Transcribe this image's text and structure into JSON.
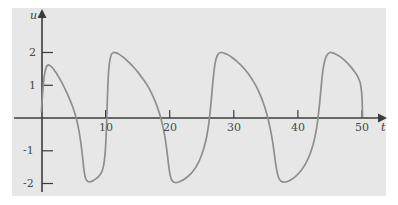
{
  "figure": {
    "background_color": "#ffffff",
    "plot_background_color": "#e7e7e7",
    "axis_color": "#3c3c3c",
    "curve_color": "#8e8e8e"
  },
  "axis": {
    "x_label": "t",
    "y_label": "u"
  },
  "ticks": {
    "x": [
      {
        "value": 10,
        "label": "10"
      },
      {
        "value": 20,
        "label": "20"
      },
      {
        "value": 30,
        "label": "30"
      },
      {
        "value": 40,
        "label": "40"
      },
      {
        "value": 50,
        "label": "50"
      }
    ],
    "y": [
      {
        "value": 2,
        "label": "2"
      },
      {
        "value": 1,
        "label": "1"
      },
      {
        "value": -1,
        "label": "-1"
      },
      {
        "value": -2,
        "label": "-2"
      }
    ]
  },
  "chart_data": {
    "type": "line",
    "title": "",
    "xlabel": "t",
    "ylabel": "u",
    "xlim": [
      -1,
      53
    ],
    "ylim": [
      -2.45,
      2.45
    ],
    "grid": false,
    "legend": "none",
    "xticks": [
      10,
      20,
      30,
      40,
      50
    ],
    "yticks": [
      2,
      1,
      -1,
      -2
    ],
    "period": 11.2,
    "amplitude_max": 2.0,
    "amplitude_min": -1.95,
    "series": [
      {
        "name": "u(t)",
        "color": "#8e8e8e",
        "points": [
          [
            0.0,
            0.2
          ],
          [
            0.12,
            0.55
          ],
          [
            0.25,
            0.9
          ],
          [
            0.4,
            1.2
          ],
          [
            0.55,
            1.4
          ],
          [
            0.72,
            1.53
          ],
          [
            0.9,
            1.6
          ],
          [
            1.1,
            1.62
          ],
          [
            1.35,
            1.6
          ],
          [
            1.65,
            1.55
          ],
          [
            2.0,
            1.46
          ],
          [
            2.4,
            1.35
          ],
          [
            2.85,
            1.2
          ],
          [
            3.35,
            1.02
          ],
          [
            3.85,
            0.82
          ],
          [
            4.35,
            0.6
          ],
          [
            4.8,
            0.38
          ],
          [
            5.2,
            0.15
          ],
          [
            5.55,
            -0.1
          ],
          [
            5.85,
            -0.38
          ],
          [
            6.1,
            -0.68
          ],
          [
            6.3,
            -0.98
          ],
          [
            6.47,
            -1.28
          ],
          [
            6.62,
            -1.55
          ],
          [
            6.78,
            -1.75
          ],
          [
            6.95,
            -1.87
          ],
          [
            7.2,
            -1.93
          ],
          [
            7.55,
            -1.95
          ],
          [
            8.0,
            -1.92
          ],
          [
            8.5,
            -1.86
          ],
          [
            9.0,
            -1.77
          ],
          [
            9.4,
            -1.65
          ],
          [
            9.65,
            -1.5
          ],
          [
            9.82,
            -1.3
          ],
          [
            9.95,
            -1.05
          ],
          [
            10.05,
            -0.75
          ],
          [
            10.13,
            -0.4
          ],
          [
            10.2,
            0.0
          ],
          [
            10.27,
            0.45
          ],
          [
            10.35,
            0.9
          ],
          [
            10.45,
            1.3
          ],
          [
            10.58,
            1.62
          ],
          [
            10.75,
            1.83
          ],
          [
            10.95,
            1.95
          ],
          [
            11.25,
            2.0
          ],
          [
            11.65,
            1.99
          ],
          [
            12.1,
            1.95
          ],
          [
            12.6,
            1.88
          ],
          [
            13.15,
            1.79
          ],
          [
            13.75,
            1.68
          ],
          [
            14.4,
            1.55
          ],
          [
            15.05,
            1.4
          ],
          [
            15.7,
            1.23
          ],
          [
            16.35,
            1.05
          ],
          [
            16.95,
            0.85
          ],
          [
            17.5,
            0.62
          ],
          [
            18.0,
            0.38
          ],
          [
            18.45,
            0.12
          ],
          [
            18.85,
            -0.18
          ],
          [
            19.2,
            -0.5
          ],
          [
            19.48,
            -0.85
          ],
          [
            19.7,
            -1.2
          ],
          [
            19.9,
            -1.52
          ],
          [
            20.1,
            -1.76
          ],
          [
            20.35,
            -1.9
          ],
          [
            20.7,
            -1.96
          ],
          [
            21.15,
            -1.97
          ],
          [
            21.7,
            -1.93
          ],
          [
            22.3,
            -1.87
          ],
          [
            22.95,
            -1.77
          ],
          [
            23.55,
            -1.65
          ],
          [
            24.1,
            -1.5
          ],
          [
            24.6,
            -1.32
          ],
          [
            25.05,
            -1.1
          ],
          [
            25.45,
            -0.85
          ],
          [
            25.8,
            -0.55
          ],
          [
            26.08,
            -0.22
          ],
          [
            26.3,
            0.15
          ],
          [
            26.5,
            0.55
          ],
          [
            26.68,
            0.95
          ],
          [
            26.88,
            1.35
          ],
          [
            27.1,
            1.67
          ],
          [
            27.38,
            1.88
          ],
          [
            27.72,
            1.98
          ],
          [
            28.15,
            2.0
          ],
          [
            28.65,
            1.97
          ],
          [
            29.2,
            1.92
          ],
          [
            29.8,
            1.84
          ],
          [
            30.45,
            1.74
          ],
          [
            31.1,
            1.62
          ],
          [
            31.75,
            1.48
          ],
          [
            32.4,
            1.32
          ],
          [
            33.0,
            1.14
          ],
          [
            33.58,
            0.94
          ],
          [
            34.1,
            0.72
          ],
          [
            34.58,
            0.48
          ],
          [
            35.02,
            0.22
          ],
          [
            35.42,
            -0.08
          ],
          [
            35.78,
            -0.4
          ],
          [
            36.08,
            -0.74
          ],
          [
            36.33,
            -1.08
          ],
          [
            36.55,
            -1.4
          ],
          [
            36.78,
            -1.66
          ],
          [
            37.05,
            -1.84
          ],
          [
            37.4,
            -1.93
          ],
          [
            37.85,
            -1.96
          ],
          [
            38.4,
            -1.94
          ],
          [
            39.0,
            -1.88
          ],
          [
            39.62,
            -1.79
          ],
          [
            40.22,
            -1.67
          ],
          [
            40.78,
            -1.53
          ],
          [
            41.3,
            -1.36
          ],
          [
            41.78,
            -1.16
          ],
          [
            42.2,
            -0.93
          ],
          [
            42.58,
            -0.66
          ],
          [
            42.9,
            -0.35
          ],
          [
            43.15,
            0.0
          ],
          [
            43.38,
            0.4
          ],
          [
            43.58,
            0.82
          ],
          [
            43.78,
            1.22
          ],
          [
            44.0,
            1.56
          ],
          [
            44.28,
            1.8
          ],
          [
            44.62,
            1.94
          ],
          [
            45.05,
            2.0
          ],
          [
            45.55,
            1.98
          ],
          [
            46.1,
            1.93
          ],
          [
            46.7,
            1.86
          ],
          [
            47.35,
            1.75
          ],
          [
            48.0,
            1.62
          ],
          [
            48.65,
            1.47
          ],
          [
            49.25,
            1.3
          ],
          [
            49.7,
            1.1
          ],
          [
            49.95,
            0.8
          ],
          [
            50.05,
            0.45
          ],
          [
            50.1,
            0.05
          ]
        ]
      }
    ]
  }
}
